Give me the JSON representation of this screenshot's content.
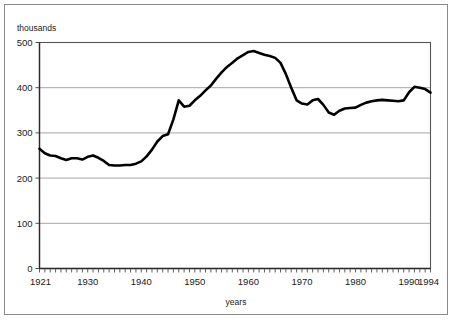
{
  "chart_data": {
    "type": "line",
    "title": "",
    "xlabel": "years",
    "ylabel": "thousands",
    "ylim": [
      0,
      500
    ],
    "xlim": [
      1921,
      1994
    ],
    "grid": true,
    "legend": null,
    "yticks": [
      0,
      100,
      200,
      300,
      400,
      500
    ],
    "ytick_labels": [
      "0",
      "100",
      "200",
      "300",
      "400",
      "500"
    ],
    "xticks": [
      1921,
      1930,
      1940,
      1950,
      1960,
      1970,
      1980,
      1990,
      1994
    ],
    "xtick_labels": [
      "1921",
      "1930",
      "1940",
      "1950",
      "1960",
      "1970",
      "1980",
      "1990",
      "1994"
    ],
    "minor_xtick_interval": 1,
    "series": [
      {
        "name": "values",
        "color": "#000000",
        "x": [
          1921,
          1922,
          1923,
          1924,
          1925,
          1926,
          1927,
          1928,
          1929,
          1930,
          1931,
          1932,
          1933,
          1934,
          1935,
          1936,
          1937,
          1938,
          1939,
          1940,
          1941,
          1942,
          1943,
          1944,
          1945,
          1946,
          1947,
          1948,
          1949,
          1950,
          1951,
          1952,
          1953,
          1954,
          1955,
          1956,
          1957,
          1958,
          1959,
          1960,
          1961,
          1962,
          1963,
          1964,
          1965,
          1966,
          1967,
          1968,
          1969,
          1970,
          1971,
          1972,
          1973,
          1974,
          1975,
          1976,
          1977,
          1978,
          1979,
          1980,
          1981,
          1982,
          1983,
          1984,
          1985,
          1986,
          1987,
          1988,
          1989,
          1990,
          1991,
          1992,
          1993,
          1994
        ],
        "values": [
          265,
          255,
          250,
          249,
          244,
          240,
          244,
          244,
          241,
          247,
          250,
          245,
          238,
          229,
          228,
          228,
          229,
          229,
          232,
          237,
          248,
          263,
          281,
          293,
          297,
          330,
          372,
          358,
          360,
          372,
          382,
          394,
          405,
          420,
          434,
          446,
          455,
          465,
          472,
          479,
          481,
          477,
          473,
          470,
          466,
          455,
          430,
          400,
          372,
          365,
          363,
          372,
          375,
          362,
          345,
          340,
          349,
          354,
          355,
          356,
          362,
          367,
          370,
          372,
          373,
          372,
          371,
          370,
          372,
          390,
          402,
          400,
          397,
          389
        ]
      }
    ]
  },
  "axes": {
    "ylabel_text": "thousands",
    "xlabel_text": "years"
  }
}
